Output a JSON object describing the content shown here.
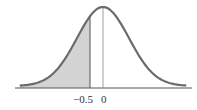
{
  "chart_data": {
    "type": "area",
    "title": "",
    "xlabel": "",
    "ylabel": "",
    "distribution": "normal",
    "mean": 0,
    "sd": 1,
    "xlim": [
      -3.2,
      3.2
    ],
    "shaded_region": {
      "from": "-inf",
      "to": -0.5
    },
    "reference_lines": [
      -0.5,
      0
    ],
    "tick_labels": [
      "−0.5",
      "0"
    ],
    "grid": false,
    "legend": null,
    "colors": {
      "curve": "#6b6b6b",
      "fill": "#d3d3d3",
      "axis": "#555555"
    }
  },
  "labels": {
    "neg_half": "−0.5",
    "zero": "0"
  }
}
